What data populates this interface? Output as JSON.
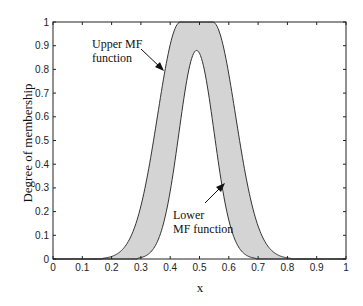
{
  "chart_data": {
    "type": "area",
    "title": "",
    "xlabel": "x",
    "ylabel": "Degree of membership",
    "xlim": [
      0,
      1
    ],
    "ylim": [
      0,
      1
    ],
    "x_ticks": [
      0,
      0.1,
      0.2,
      0.3,
      0.4,
      0.5,
      0.6,
      0.7,
      0.8,
      0.9,
      1
    ],
    "x_tick_labels": [
      "0",
      "0.1",
      "0.2",
      "0.3",
      "0.4",
      "0.5",
      "0.6",
      "0.7",
      "0.8",
      "0.9",
      "1"
    ],
    "y_ticks": [
      0,
      0.1,
      0.2,
      0.3,
      0.4,
      0.5,
      0.6,
      0.7,
      0.8,
      0.9,
      1
    ],
    "y_tick_labels": [
      "0",
      "0.1",
      "0.2",
      "0.3",
      "0.4",
      "0.5",
      "0.6",
      "0.7",
      "0.8",
      "0.9",
      "1"
    ],
    "grid": false,
    "legend": null,
    "fill_color": "#d4d4d4",
    "line_color": "#333333",
    "series": [
      {
        "name": "Upper MF function",
        "shape": "gaussian with flat top",
        "flat_top": [
          0.435,
          0.545
        ],
        "sigma": 0.078,
        "height": 1.0,
        "x": [
          0.15,
          0.2,
          0.25,
          0.3,
          0.35,
          0.4,
          0.435,
          0.49,
          0.545,
          0.6,
          0.65,
          0.7,
          0.75,
          0.8,
          0.85
        ],
        "values": [
          0.01,
          0.04,
          0.12,
          0.27,
          0.49,
          0.9,
          1.0,
          1.0,
          1.0,
          0.77,
          0.47,
          0.23,
          0.09,
          0.03,
          0.0
        ]
      },
      {
        "name": "Lower MF function",
        "shape": "gaussian",
        "center": 0.49,
        "sigma": 0.06,
        "height": 0.88,
        "x": [
          0.2,
          0.25,
          0.3,
          0.35,
          0.4,
          0.45,
          0.49,
          0.55,
          0.6,
          0.65,
          0.7,
          0.75,
          0.8
        ],
        "values": [
          0.0,
          0.03,
          0.06,
          0.22,
          0.42,
          0.75,
          0.88,
          0.53,
          0.27,
          0.12,
          0.04,
          0.01,
          0.0
        ]
      }
    ],
    "annotations": [
      {
        "text_lines": [
          "Upper MF",
          "function"
        ],
        "points_to": "upper curve left flank at ~(0.38, 0.80)"
      },
      {
        "text_lines": [
          "Lower",
          "MF function"
        ],
        "points_to": "lower curve right flank at ~(0.59, 0.32)"
      }
    ]
  },
  "labels": {
    "ylabel": "Degree of membership",
    "xlabel": "x",
    "upper_line1": "Upper MF",
    "upper_line2": "function",
    "lower_line1": "Lower",
    "lower_line2": "MF function"
  }
}
